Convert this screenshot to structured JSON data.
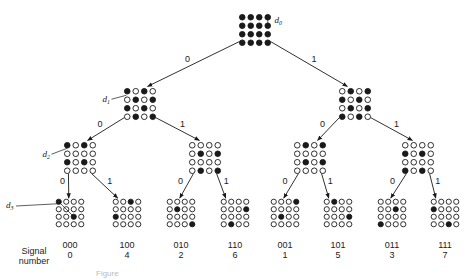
{
  "figure": {
    "caption": "Figure",
    "row_label_line1": "Signal",
    "row_label_line2": "number",
    "distance_labels": [
      "d0",
      "d1",
      "d2",
      "d3"
    ],
    "colors": {
      "ink": "#1a1a1a",
      "background": "#ffffff"
    }
  },
  "tree": {
    "root": {
      "id": "root",
      "cx": 255,
      "cy": 30,
      "pattern": [
        [
          1,
          1,
          1,
          1
        ],
        [
          1,
          1,
          1,
          1
        ],
        [
          1,
          1,
          1,
          1
        ],
        [
          1,
          1,
          1,
          1
        ]
      ],
      "label": "d0"
    },
    "level1": [
      {
        "id": "0",
        "branch": "0",
        "cx": 140,
        "cy": 104,
        "pattern": [
          [
            1,
            0,
            1,
            0
          ],
          [
            0,
            1,
            0,
            1
          ],
          [
            1,
            0,
            1,
            0
          ],
          [
            0,
            1,
            0,
            1
          ]
        ],
        "label": "d1"
      },
      {
        "id": "1",
        "branch": "1",
        "cx": 355,
        "cy": 104,
        "pattern": [
          [
            0,
            1,
            0,
            1
          ],
          [
            1,
            0,
            1,
            0
          ],
          [
            0,
            1,
            0,
            1
          ],
          [
            1,
            0,
            1,
            0
          ]
        ]
      }
    ],
    "level2": [
      {
        "id": "00",
        "branch": "0",
        "parent": 0,
        "cx": 80,
        "cy": 158,
        "pattern": [
          [
            1,
            0,
            1,
            0
          ],
          [
            0,
            0,
            0,
            0
          ],
          [
            1,
            0,
            1,
            0
          ],
          [
            0,
            0,
            0,
            0
          ]
        ],
        "label": "d2"
      },
      {
        "id": "01",
        "branch": "1",
        "parent": 0,
        "cx": 205,
        "cy": 158,
        "pattern": [
          [
            0,
            0,
            0,
            0
          ],
          [
            0,
            1,
            0,
            1
          ],
          [
            0,
            0,
            0,
            0
          ],
          [
            0,
            1,
            0,
            1
          ]
        ]
      },
      {
        "id": "10",
        "branch": "0",
        "parent": 1,
        "cx": 310,
        "cy": 158,
        "pattern": [
          [
            0,
            1,
            0,
            1
          ],
          [
            0,
            0,
            0,
            0
          ],
          [
            0,
            1,
            0,
            1
          ],
          [
            0,
            0,
            0,
            0
          ]
        ]
      },
      {
        "id": "11",
        "branch": "1",
        "parent": 1,
        "cx": 418,
        "cy": 158,
        "pattern": [
          [
            0,
            0,
            0,
            0
          ],
          [
            1,
            0,
            1,
            0
          ],
          [
            0,
            0,
            0,
            0
          ],
          [
            1,
            0,
            1,
            0
          ]
        ]
      }
    ],
    "leaves": [
      {
        "code": "000",
        "number": "0",
        "branch": "0",
        "parent": 0,
        "cx": 70,
        "cy": 213,
        "pattern": [
          [
            1,
            0,
            0,
            0
          ],
          [
            0,
            0,
            0,
            0
          ],
          [
            0,
            0,
            1,
            0
          ],
          [
            0,
            0,
            0,
            0
          ]
        ],
        "label": "d3"
      },
      {
        "code": "100",
        "number": "4",
        "branch": "1",
        "parent": 0,
        "cx": 127,
        "cy": 213,
        "pattern": [
          [
            0,
            0,
            1,
            0
          ],
          [
            0,
            0,
            0,
            0
          ],
          [
            1,
            0,
            0,
            0
          ],
          [
            0,
            0,
            0,
            0
          ]
        ]
      },
      {
        "code": "010",
        "number": "2",
        "branch": "0",
        "parent": 1,
        "cx": 181,
        "cy": 213,
        "pattern": [
          [
            0,
            0,
            0,
            0
          ],
          [
            0,
            1,
            0,
            0
          ],
          [
            0,
            0,
            0,
            0
          ],
          [
            0,
            0,
            0,
            1
          ]
        ]
      },
      {
        "code": "110",
        "number": "6",
        "branch": "1",
        "parent": 1,
        "cx": 235,
        "cy": 213,
        "pattern": [
          [
            0,
            0,
            0,
            0
          ],
          [
            0,
            0,
            0,
            1
          ],
          [
            0,
            0,
            0,
            0
          ],
          [
            0,
            1,
            0,
            0
          ]
        ]
      },
      {
        "code": "001",
        "number": "1",
        "branch": "0",
        "parent": 2,
        "cx": 285,
        "cy": 213,
        "pattern": [
          [
            0,
            0,
            0,
            1
          ],
          [
            0,
            0,
            0,
            0
          ],
          [
            0,
            1,
            0,
            0
          ],
          [
            0,
            0,
            0,
            0
          ]
        ]
      },
      {
        "code": "101",
        "number": "5",
        "branch": "1",
        "parent": 2,
        "cx": 338,
        "cy": 213,
        "pattern": [
          [
            0,
            1,
            0,
            0
          ],
          [
            0,
            0,
            0,
            0
          ],
          [
            0,
            0,
            0,
            1
          ],
          [
            0,
            0,
            0,
            0
          ]
        ]
      },
      {
        "code": "011",
        "number": "3",
        "branch": "0",
        "parent": 3,
        "cx": 392,
        "cy": 213,
        "pattern": [
          [
            0,
            0,
            0,
            0
          ],
          [
            0,
            0,
            1,
            0
          ],
          [
            0,
            0,
            0,
            0
          ],
          [
            1,
            0,
            0,
            0
          ]
        ]
      },
      {
        "code": "111",
        "number": "7",
        "branch": "1",
        "parent": 3,
        "cx": 445,
        "cy": 213,
        "pattern": [
          [
            0,
            0,
            0,
            0
          ],
          [
            1,
            0,
            0,
            0
          ],
          [
            0,
            0,
            0,
            0
          ],
          [
            0,
            0,
            1,
            0
          ]
        ]
      }
    ]
  }
}
